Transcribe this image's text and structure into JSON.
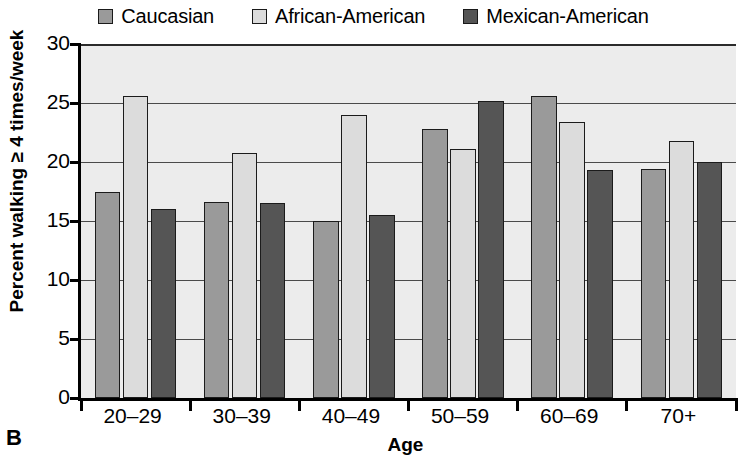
{
  "panel": {
    "label": "B"
  },
  "legend": {
    "position": "top-center",
    "items": [
      {
        "label": "Caucasian",
        "color": "#9a9a9a",
        "icon": "legend-swatch-icon"
      },
      {
        "label": "African-American",
        "color": "#dcdcdc",
        "icon": "legend-swatch-icon"
      },
      {
        "label": "Mexican-American",
        "color": "#555555",
        "icon": "legend-swatch-icon"
      }
    ]
  },
  "axes": {
    "y_title": "Percent walking ≥ 4 times/week",
    "x_title": "Age",
    "y_ticks": [
      "30",
      "25",
      "20",
      "15",
      "10",
      "5",
      "0"
    ]
  },
  "colors": {
    "plot_background": "#ececec",
    "axis": "#000000",
    "gridline": "#4a4a4a",
    "bar_outline": "#1b1b1b"
  },
  "chart_data": {
    "type": "bar",
    "title": "",
    "xlabel": "Age",
    "ylabel": "Percent walking ≥ 4 times/week",
    "ylim": [
      0,
      30
    ],
    "ytick_values": [
      0,
      5,
      10,
      15,
      20,
      25,
      30
    ],
    "grid": true,
    "legend_position": "top-center",
    "categories": [
      "20–29",
      "30–39",
      "40–49",
      "50–59",
      "60–69",
      "70+"
    ],
    "series": [
      {
        "name": "Caucasian",
        "color": "#9a9a9a",
        "values": [
          17.5,
          16.6,
          15.0,
          22.8,
          25.6,
          19.4
        ]
      },
      {
        "name": "African-American",
        "color": "#dcdcdc",
        "values": [
          25.6,
          20.8,
          24.0,
          21.1,
          23.4,
          21.8
        ]
      },
      {
        "name": "Mexican-American",
        "color": "#555555",
        "values": [
          16.0,
          16.5,
          15.5,
          25.2,
          19.3,
          20.0
        ]
      }
    ]
  }
}
